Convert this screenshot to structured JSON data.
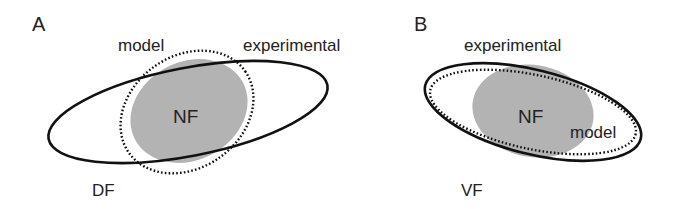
{
  "figure": {
    "colors": {
      "background": "#ffffff",
      "outline": "#111111",
      "fill_region": "#b3b3b3",
      "text": "#222222"
    },
    "panels": [
      {
        "letter": "A",
        "field_label": "DF",
        "center_label": "NF",
        "labels": {
          "model": "model",
          "experimental": "experimental"
        },
        "description": "Solid 'experimental' ellipse elongated and tilted upward to the right; dotted 'model' ellipse is rounder, crossing the solid one; gray NF region inside both."
      },
      {
        "letter": "B",
        "field_label": "VF",
        "center_label": "NF",
        "labels": {
          "model": "model",
          "experimental": "experimental"
        },
        "description": "Solid 'experimental' ellipse tilted downward to the right; dotted 'model' ellipse nearly coincident just inside it; gray NF region inside."
      }
    ],
    "legend": {
      "solid_line": "experimental",
      "dotted_line": "model",
      "gray_fill": "NF"
    }
  }
}
